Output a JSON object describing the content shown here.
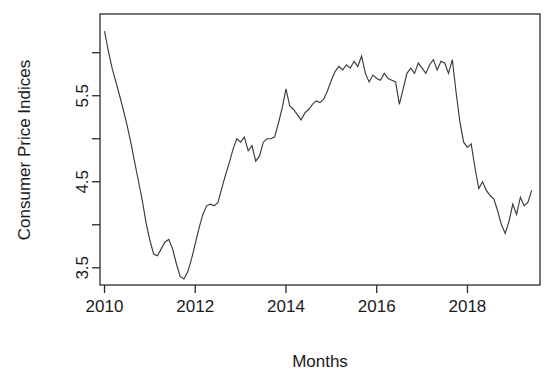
{
  "chart_data": {
    "type": "line",
    "title": "",
    "xlabel": "Months",
    "ylabel": "Consumer Price Indices",
    "xlim": [
      2009.9,
      2019.6
    ],
    "ylim": [
      3.3,
      6.45
    ],
    "grid": false,
    "legend": null,
    "x_ticks": [
      2010,
      2012,
      2014,
      2016,
      2018
    ],
    "x_tick_labels": [
      "2010",
      "2012",
      "2014",
      "2016",
      "2018"
    ],
    "y_ticks": [
      3.5,
      4.0,
      4.5,
      5.0,
      5.5,
      6.0
    ],
    "y_tick_labels": [
      "3.5",
      "",
      "4.5",
      "",
      "5.5",
      ""
    ],
    "series_name": "Consumer Price Indices",
    "line_color": "#3a3a3a",
    "x": [
      2010.0,
      2010.083,
      2010.167,
      2010.25,
      2010.333,
      2010.417,
      2010.5,
      2010.583,
      2010.667,
      2010.75,
      2010.833,
      2010.917,
      2011.0,
      2011.083,
      2011.167,
      2011.25,
      2011.333,
      2011.417,
      2011.5,
      2011.583,
      2011.667,
      2011.75,
      2011.833,
      2011.917,
      2012.0,
      2012.083,
      2012.167,
      2012.25,
      2012.333,
      2012.417,
      2012.5,
      2012.583,
      2012.667,
      2012.75,
      2012.833,
      2012.917,
      2013.0,
      2013.083,
      2013.167,
      2013.25,
      2013.333,
      2013.417,
      2013.5,
      2013.583,
      2013.667,
      2013.75,
      2013.833,
      2013.917,
      2014.0,
      2014.083,
      2014.167,
      2014.25,
      2014.333,
      2014.417,
      2014.5,
      2014.583,
      2014.667,
      2014.75,
      2014.833,
      2014.917,
      2015.0,
      2015.083,
      2015.167,
      2015.25,
      2015.333,
      2015.417,
      2015.5,
      2015.583,
      2015.667,
      2015.75,
      2015.833,
      2015.917,
      2016.0,
      2016.083,
      2016.167,
      2016.25,
      2016.333,
      2016.417,
      2016.5,
      2016.583,
      2016.667,
      2016.75,
      2016.833,
      2016.917,
      2017.0,
      2017.083,
      2017.167,
      2017.25,
      2017.333,
      2017.417,
      2017.5,
      2017.583,
      2017.667,
      2017.75,
      2017.833,
      2017.917,
      2018.0,
      2018.083,
      2018.167,
      2018.25,
      2018.333,
      2018.417,
      2018.5,
      2018.583,
      2018.667,
      2018.75,
      2018.833,
      2018.917,
      2019.0,
      2019.083,
      2019.167,
      2019.25,
      2019.333,
      2019.417
    ],
    "values": [
      6.25,
      6.02,
      5.82,
      5.66,
      5.5,
      5.33,
      5.15,
      4.95,
      4.72,
      4.5,
      4.28,
      4.02,
      3.82,
      3.66,
      3.64,
      3.72,
      3.8,
      3.83,
      3.72,
      3.55,
      3.4,
      3.37,
      3.45,
      3.6,
      3.78,
      3.96,
      4.12,
      4.22,
      4.24,
      4.22,
      4.26,
      4.42,
      4.58,
      4.72,
      4.88,
      5.0,
      4.96,
      5.02,
      4.86,
      4.92,
      4.74,
      4.8,
      4.96,
      5.0,
      5.0,
      5.02,
      5.18,
      5.36,
      5.58,
      5.38,
      5.34,
      5.28,
      5.22,
      5.3,
      5.34,
      5.4,
      5.44,
      5.42,
      5.46,
      5.56,
      5.68,
      5.78,
      5.84,
      5.8,
      5.86,
      5.82,
      5.9,
      5.84,
      5.96,
      5.76,
      5.66,
      5.74,
      5.7,
      5.68,
      5.76,
      5.7,
      5.68,
      5.66,
      5.4,
      5.58,
      5.76,
      5.82,
      5.76,
      5.88,
      5.82,
      5.76,
      5.86,
      5.92,
      5.8,
      5.9,
      5.88,
      5.76,
      5.92,
      5.54,
      5.2,
      4.96,
      4.9,
      4.94,
      4.66,
      4.42,
      4.5,
      4.4,
      4.34,
      4.3,
      4.16,
      4.0,
      3.9,
      4.04,
      4.24,
      4.12,
      4.32,
      4.22,
      4.26,
      4.4
    ]
  },
  "figure": {
    "y_axis_title": "Consumer Price Indices",
    "x_axis_title": "Months",
    "y_labels": [
      "5.5",
      "4.5",
      "3.5"
    ],
    "x_labels": [
      "2010",
      "2012",
      "2014",
      "2016",
      "2018"
    ]
  }
}
